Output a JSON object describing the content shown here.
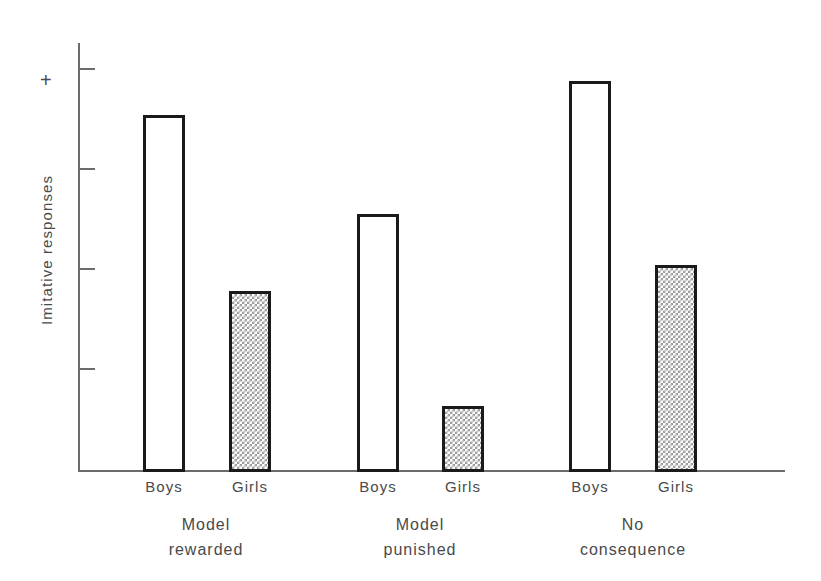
{
  "chart_data": {
    "type": "bar",
    "title": "",
    "subtitle": "",
    "xlabel": "",
    "ylabel": "Imitative responses",
    "y_axis_top_marker": "+",
    "ylim": [
      0,
      4.02
    ],
    "y_tick_values": [
      1,
      2,
      3,
      4
    ],
    "y_tick_labels": [
      "",
      "",
      "",
      ""
    ],
    "grid": false,
    "legend": "none",
    "categories": [
      "Boys",
      "Girls",
      "Boys",
      "Girls",
      "Boys",
      "Girls"
    ],
    "groups": [
      "Model rewarded",
      "Model punished",
      "No consequence"
    ],
    "series": [
      {
        "name": "Imitative responses",
        "values": [
          3.42,
          1.75,
          2.49,
          0.62,
          3.76,
          2.02
        ]
      }
    ],
    "bars": [
      {
        "group": "Model rewarded",
        "category": "Boys",
        "value": 3.42,
        "fill": "open"
      },
      {
        "group": "Model rewarded",
        "category": "Girls",
        "value": 1.75,
        "fill": "stipple"
      },
      {
        "group": "Model punished",
        "category": "Boys",
        "value": 2.49,
        "fill": "open"
      },
      {
        "group": "Model punished",
        "category": "Girls",
        "value": 0.62,
        "fill": "stipple"
      },
      {
        "group": "No consequence",
        "category": "Boys",
        "value": 3.76,
        "fill": "open"
      },
      {
        "group": "No consequence",
        "category": "Girls",
        "value": 2.02,
        "fill": "stipple"
      }
    ],
    "colors": {
      "bar_outline": "#1a1a1a",
      "bar_open_fill": "#ffffff",
      "bar_stipple_fill": "#9a9a9a",
      "axis": "#6b6b6b",
      "text": "#4a4a4a",
      "background": "#ffffff"
    }
  },
  "axis": {
    "y_title": "Imitative responses",
    "plus_marker": "+"
  },
  "cat_labels": [
    {
      "text": "Boys",
      "x": 164
    },
    {
      "text": "Girls",
      "x": 250
    },
    {
      "text": "Boys",
      "x": 378
    },
    {
      "text": "Girls",
      "x": 463
    },
    {
      "text": "Boys",
      "x": 590
    },
    {
      "text": "Girls",
      "x": 676
    }
  ],
  "group_labels": [
    {
      "line1": "Model",
      "line2": "rewarded",
      "x": 206
    },
    {
      "line1": "Model",
      "line2": "punished",
      "x": 420
    },
    {
      "line1": "No",
      "line2": "consequence",
      "x": 633
    }
  ],
  "bars_geometry": [
    {
      "left": 143,
      "top": 115,
      "width": 42,
      "height": 357,
      "fill": "open"
    },
    {
      "left": 229,
      "top": 291,
      "width": 42,
      "height": 181,
      "fill": "stipple"
    },
    {
      "left": 357,
      "top": 214,
      "width": 42,
      "height": 258,
      "fill": "open"
    },
    {
      "left": 442,
      "top": 406,
      "width": 42,
      "height": 66,
      "fill": "stipple"
    },
    {
      "left": 569,
      "top": 81,
      "width": 42,
      "height": 391,
      "fill": "open"
    },
    {
      "left": 655,
      "top": 265,
      "width": 42,
      "height": 207,
      "fill": "stipple"
    }
  ],
  "ticks": [
    {
      "top": 68
    },
    {
      "top": 168
    },
    {
      "top": 268
    },
    {
      "top": 368
    }
  ]
}
